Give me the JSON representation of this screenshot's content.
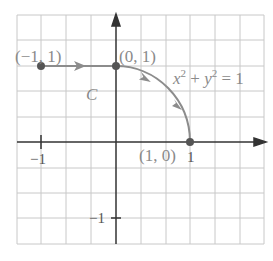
{
  "diagram": {
    "title": "",
    "curve_label": "C",
    "equation": {
      "x": "x",
      "y": "y",
      "exp": "2",
      "plus": "+",
      "equals": "= 1"
    },
    "points": [
      {
        "label": "(−1, 1)",
        "x": -1,
        "y": 1
      },
      {
        "label": "(0, 1)",
        "x": 0,
        "y": 1
      },
      {
        "label": "(1, 0)",
        "x": 1,
        "y": 0
      }
    ],
    "ticks": {
      "x_neg": "−1",
      "x_pos": "1",
      "y_neg": "−1"
    },
    "colors": {
      "curve": "#8c8c8c",
      "axis": "#333333",
      "grid": "#c8c8c8",
      "point": "#555555",
      "label": "#8a8a8a"
    },
    "grid": {
      "x_range": [
        -1.5,
        2
      ],
      "y_range": [
        -1.3,
        1.7
      ],
      "step": 0.5
    }
  }
}
